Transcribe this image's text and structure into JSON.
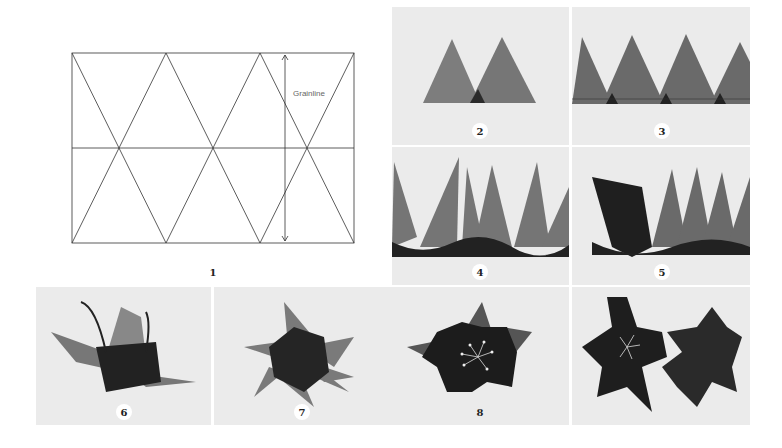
{
  "figure": {
    "diagram": {
      "label": "1",
      "grainline_text": "Grainline",
      "line_color": "#333333"
    },
    "panels": [
      {
        "label": "2",
        "description": "two overlapping triangles"
      },
      {
        "label": "3",
        "description": "row of triangles stitched along base"
      },
      {
        "label": "4",
        "description": "gathered triangle strip"
      },
      {
        "label": "5",
        "description": "strip rolled into flower"
      },
      {
        "label": "6",
        "description": "flower side view"
      },
      {
        "label": "7",
        "description": "flower top view"
      },
      {
        "label": "8",
        "description": "flower with stamens"
      },
      {
        "label": "",
        "description": "two finished flowers"
      }
    ],
    "colors": {
      "photo_bg": "#ebebeb",
      "fabric_light": "#7a7a7a",
      "fabric_dark": "#2a2a2a"
    }
  }
}
